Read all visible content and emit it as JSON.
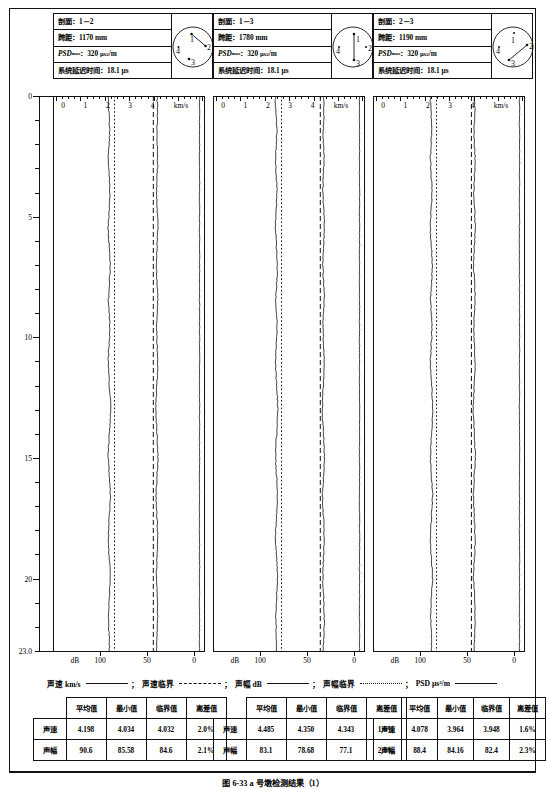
{
  "figure": {
    "caption": "图 6-33  a 号墩检测结果（1）"
  },
  "panels": [
    {
      "id": "panel-1-2",
      "info": {
        "section_label": "剖面：",
        "section_value": "1－2",
        "span_label": "跨距：",
        "span_value": "1170 mm",
        "psd_label": "PSD",
        "psd_sub": "max",
        "psd_colon": "：",
        "psd_value": "320",
        "psd_unit": "μs",
        "psd_unit_sup": "2",
        "psd_unit_tail": "/m",
        "delay_label": "系统延迟时间：",
        "delay_value": "18.1 μs"
      },
      "circle": {
        "points": [
          "1",
          "2",
          "3",
          "4"
        ],
        "connection": "1-2"
      },
      "top_axis": {
        "unit": "km/s",
        "ticks": [
          "0",
          "1",
          "2",
          "3",
          "4"
        ]
      },
      "bottom_axis": {
        "unit": "dB",
        "ticks": [
          "100",
          "50",
          "0"
        ]
      }
    },
    {
      "id": "panel-1-3",
      "info": {
        "section_label": "剖面：",
        "section_value": "1－3",
        "span_label": "跨距：",
        "span_value": "1780 mm",
        "psd_label": "PSD",
        "psd_sub": "max",
        "psd_colon": "：",
        "psd_value": "320",
        "psd_unit": "μs",
        "psd_unit_sup": "2",
        "psd_unit_tail": "/m",
        "delay_label": "系统延迟时间：",
        "delay_value": "18.1 μs"
      },
      "circle": {
        "points": [
          "1",
          "2",
          "3",
          "4"
        ],
        "connection": "1-3"
      },
      "top_axis": {
        "unit": "km/s",
        "ticks": [
          "0",
          "1",
          "2",
          "3",
          "4"
        ]
      },
      "bottom_axis": {
        "unit": "dB",
        "ticks": [
          "100",
          "50",
          "0"
        ]
      }
    },
    {
      "id": "panel-2-3",
      "info": {
        "section_label": "剖面：",
        "section_value": "2－3",
        "span_label": "跨距：",
        "span_value": "1190 mm",
        "psd_label": "PSD",
        "psd_sub": "max",
        "psd_colon": "：",
        "psd_value": "320",
        "psd_unit": "μs",
        "psd_unit_sup": "2",
        "psd_unit_tail": "/m",
        "delay_label": "系统延迟时间：",
        "delay_value": "18.1 μs"
      },
      "circle": {
        "points": [
          "1",
          "2",
          "3",
          "4"
        ],
        "connection": "2-3"
      },
      "top_axis": {
        "unit": "km/s",
        "ticks": [
          "0",
          "1",
          "2",
          "3",
          "4"
        ]
      },
      "bottom_axis": {
        "unit": "dB",
        "ticks": [
          "100",
          "50",
          "0"
        ]
      }
    }
  ],
  "depth_axis": {
    "labels": [
      "0",
      "5",
      "10",
      "15",
      "20",
      "23.0"
    ],
    "min": 0,
    "max": 23.0
  },
  "legend": [
    {
      "label": "声速 km/s",
      "style": "solid"
    },
    {
      "label": "声速临界",
      "style": "dashed"
    },
    {
      "label": "声幅 dB",
      "style": "solid"
    },
    {
      "label": "声幅临界",
      "style": "dotted"
    },
    {
      "label": "PSD μs²/m",
      "style": "solid"
    }
  ],
  "legend_sep": "；",
  "tables": [
    {
      "id": "table-1-2",
      "headers": [
        "",
        "平均值",
        "最小值",
        "临界值",
        "离差值"
      ],
      "rows": [
        {
          "label": "声速",
          "avg": "4.198",
          "min": "4.034",
          "crit": "4.032",
          "dev": "2.0%"
        },
        {
          "label": "声幅",
          "avg": "90.6",
          "min": "85.58",
          "crit": "84.6",
          "dev": "2.1%"
        }
      ]
    },
    {
      "id": "table-1-3",
      "headers": [
        "",
        "平均值",
        "最小值",
        "临界值",
        "离差值"
      ],
      "rows": [
        {
          "label": "声速",
          "avg": "4.485",
          "min": "4.350",
          "crit": "4.343",
          "dev": "1.6%"
        },
        {
          "label": "声幅",
          "avg": "83.1",
          "min": "78.68",
          "crit": "77.1",
          "dev": "2.3%"
        }
      ]
    },
    {
      "id": "table-2-3",
      "headers": [
        "",
        "平均值",
        "最小值",
        "临界值",
        "离差值"
      ],
      "rows": [
        {
          "label": "声速",
          "avg": "4.078",
          "min": "3.964",
          "crit": "3.948",
          "dev": "1.6%"
        },
        {
          "label": "声幅",
          "avg": "88.4",
          "min": "84.16",
          "crit": "82.4",
          "dev": "2.3%"
        }
      ]
    }
  ],
  "chart_data": {
    "type": "line",
    "xlabel_top": "km/s",
    "xlabel_bottom": "dB",
    "ylabel": "深度 (m)",
    "ylim": [
      0,
      23.0
    ],
    "xlim_velocity": [
      0,
      4.8
    ],
    "xlim_amplitude": [
      110,
      0
    ],
    "grid": false,
    "panels": [
      {
        "name": "1－2",
        "critical_velocity": 4.032,
        "critical_amplitude": 84.6,
        "mean_velocity": 4.198,
        "mean_amplitude": 90.6,
        "psd_max": 320,
        "depths": [
          0,
          0.5,
          1,
          1.5,
          2,
          2.5,
          3,
          3.5,
          4,
          4.5,
          5,
          5.5,
          6,
          6.5,
          7,
          7.5,
          8,
          8.5,
          9,
          9.5,
          10,
          10.5,
          11,
          11.5,
          12,
          12.5,
          13,
          13.5,
          14,
          14.5,
          15,
          15.5,
          16,
          16.5,
          17,
          17.5,
          18,
          18.5,
          19,
          19.5,
          20,
          20.5,
          21,
          21.5,
          22,
          22.5,
          23
        ],
        "velocity": [
          4.2,
          4.22,
          4.21,
          4.18,
          4.2,
          4.23,
          4.22,
          4.19,
          4.17,
          4.2,
          4.22,
          4.24,
          4.21,
          4.18,
          4.16,
          4.19,
          4.22,
          4.23,
          4.2,
          4.17,
          4.19,
          4.21,
          4.23,
          4.22,
          4.19,
          4.16,
          4.14,
          4.17,
          4.2,
          4.22,
          4.24,
          4.21,
          4.18,
          4.15,
          4.17,
          4.2,
          4.22,
          4.23,
          4.21,
          4.18,
          4.16,
          4.19,
          4.21,
          4.23,
          4.22,
          4.2,
          4.18
        ],
        "amplitude": [
          91.5,
          90.8,
          90.2,
          89.6,
          90.4,
          91.2,
          90.9,
          90.1,
          89.4,
          90.0,
          90.8,
          91.4,
          90.6,
          89.8,
          89.0,
          89.7,
          90.5,
          91.0,
          90.3,
          89.5,
          89.9,
          90.6,
          91.2,
          90.8,
          90.0,
          89.2,
          88.6,
          89.3,
          90.1,
          90.8,
          91.3,
          90.5,
          89.7,
          88.9,
          89.5,
          90.2,
          90.9,
          91.1,
          90.4,
          89.6,
          89.0,
          89.8,
          90.5,
          91.0,
          90.7,
          90.2,
          89.8
        ]
      },
      {
        "name": "1－3",
        "critical_velocity": 4.343,
        "critical_amplitude": 77.1,
        "mean_velocity": 4.485,
        "mean_amplitude": 83.1,
        "depths": [
          0,
          0.5,
          1,
          1.5,
          2,
          2.5,
          3,
          3.5,
          4,
          4.5,
          5,
          5.5,
          6,
          6.5,
          7,
          7.5,
          8,
          8.5,
          9,
          9.5,
          10,
          10.5,
          11,
          11.5,
          12,
          12.5,
          13,
          13.5,
          14,
          14.5,
          15,
          15.5,
          16,
          16.5,
          17,
          17.5,
          18,
          18.5,
          19,
          19.5,
          20,
          20.5,
          21,
          21.5,
          22,
          22.5,
          23
        ],
        "velocity": [
          4.49,
          4.51,
          4.5,
          4.47,
          4.49,
          4.52,
          4.5,
          4.47,
          4.45,
          4.48,
          4.51,
          4.53,
          4.5,
          4.47,
          4.45,
          4.48,
          4.51,
          4.52,
          4.49,
          4.46,
          4.48,
          4.5,
          4.52,
          4.51,
          4.48,
          4.45,
          4.43,
          4.46,
          4.49,
          4.51,
          4.53,
          4.5,
          4.47,
          4.44,
          4.46,
          4.49,
          4.51,
          4.52,
          4.5,
          4.47,
          4.45,
          4.48,
          4.5,
          4.52,
          4.51,
          4.49,
          4.47
        ],
        "amplitude": [
          83.8,
          83.2,
          82.6,
          82.0,
          82.8,
          83.5,
          83.2,
          82.4,
          81.8,
          82.4,
          83.1,
          83.7,
          82.9,
          82.1,
          81.4,
          82.0,
          82.8,
          83.3,
          82.6,
          81.8,
          82.2,
          82.9,
          83.5,
          83.1,
          82.3,
          81.5,
          80.9,
          81.6,
          82.4,
          83.1,
          83.6,
          82.8,
          82.0,
          81.2,
          81.8,
          82.5,
          83.2,
          83.4,
          82.7,
          81.9,
          81.3,
          82.1,
          82.8,
          83.3,
          83.0,
          82.5,
          82.1
        ]
      },
      {
        "name": "2－3",
        "critical_velocity": 3.948,
        "critical_amplitude": 82.4,
        "mean_velocity": 4.078,
        "mean_amplitude": 88.4,
        "depths": [
          0,
          0.5,
          1,
          1.5,
          2,
          2.5,
          3,
          3.5,
          4,
          4.5,
          5,
          5.5,
          6,
          6.5,
          7,
          7.5,
          8,
          8.5,
          9,
          9.5,
          10,
          10.5,
          11,
          11.5,
          12,
          12.5,
          13,
          13.5,
          14,
          14.5,
          15,
          15.5,
          16,
          16.5,
          17,
          17.5,
          18,
          18.5,
          19,
          19.5,
          20,
          20.5,
          21,
          21.5,
          22,
          22.5,
          23
        ],
        "velocity": [
          4.08,
          4.1,
          4.09,
          4.06,
          4.08,
          4.11,
          4.1,
          4.07,
          4.05,
          4.08,
          4.1,
          4.12,
          4.09,
          4.06,
          4.04,
          4.07,
          4.1,
          4.11,
          4.08,
          4.05,
          4.07,
          4.09,
          4.11,
          4.1,
          4.07,
          4.04,
          4.02,
          4.05,
          4.08,
          4.1,
          4.12,
          4.09,
          4.06,
          4.03,
          4.05,
          4.08,
          4.1,
          4.11,
          4.09,
          4.06,
          4.04,
          4.07,
          4.09,
          4.11,
          4.1,
          4.08,
          4.06
        ],
        "amplitude": [
          89.2,
          88.6,
          88.0,
          87.4,
          88.2,
          88.9,
          88.6,
          87.8,
          87.2,
          87.8,
          88.5,
          89.1,
          88.3,
          87.5,
          86.8,
          87.4,
          88.2,
          88.7,
          88.0,
          87.2,
          87.6,
          88.3,
          88.9,
          88.5,
          87.7,
          86.9,
          86.3,
          87.0,
          87.8,
          88.5,
          89.0,
          88.2,
          87.4,
          86.6,
          87.2,
          87.9,
          88.6,
          88.8,
          88.1,
          87.3,
          86.7,
          87.5,
          88.2,
          88.7,
          88.4,
          87.9,
          87.5
        ]
      }
    ]
  }
}
